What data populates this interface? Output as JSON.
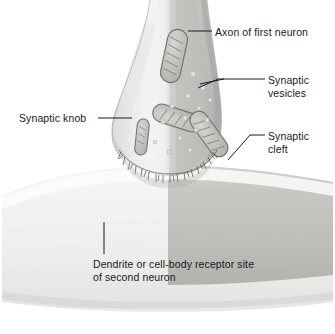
{
  "figure": {
    "background_color": "#ffffff",
    "text_color": "#1a1a1a",
    "leader_line_color": "#1a1a1a"
  },
  "labels": {
    "axon": "Axon of first neuron",
    "vesicles_line1": "Synaptic",
    "vesicles_line2": "vesicles",
    "cleft_line1": "Synaptic",
    "cleft_line2": "cleft",
    "knob": "Synaptic knob",
    "dendrite_line1": "Dendrite or cell-body receptor site",
    "dendrite_line2": "of second neuron"
  },
  "structures": {
    "axon": {
      "name": "axon-of-first-neuron",
      "fill_light": "#efefee",
      "fill_mid": "#d6d6d4",
      "fill_dark": "#b4b4b1"
    },
    "synaptic_knob": {
      "name": "synaptic-knob",
      "fill_light": "#e8e8e6",
      "fill_dark": "#a9a9a6"
    },
    "synaptic_cleft": {
      "name": "synaptic-cleft",
      "stroke": "#555553"
    },
    "dendrite": {
      "name": "dendrite-or-cell-body-receptor-site",
      "fill_light": "#f1f1f0",
      "fill_dark": "#bcbcba"
    },
    "mitochondria_count": 4,
    "mitochondria_fill": "#c4c4c1",
    "mitochondria_stroke": "#6f6f6d",
    "vesicles_count": 14,
    "vesicles_fill": "#dedede"
  }
}
